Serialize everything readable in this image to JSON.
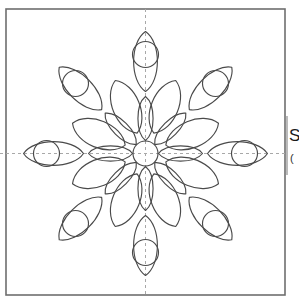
{
  "document": {
    "type": "stencil-pattern-sheet",
    "background_color": "#ffffff"
  },
  "frame": {
    "name": "pattern-border",
    "x": 6,
    "y": 9,
    "width": 279,
    "height": 286,
    "stroke_color": "#6e6e6e",
    "stroke_width": 1.6,
    "fill": "none"
  },
  "guides": {
    "stroke_color": "#a8a8a8",
    "dash": "3 3",
    "stroke_width": 1,
    "vertical": {
      "x": 145.5,
      "y1": 9,
      "y2": 295
    },
    "horizontal": {
      "y": 153.5,
      "x1": 0,
      "x2": 287
    }
  },
  "margin_rule": {
    "name": "right-margin-rule",
    "x": 287,
    "y1": 116,
    "y2": 175,
    "stroke_color": "#8c8c8c",
    "stroke_width": 1.2
  },
  "side_text": {
    "label": "Sp",
    "subtext": "("
  },
  "motif": {
    "name": "floral-mandala",
    "center_x": 145.5,
    "center_y": 153.5,
    "stroke_color": "#4a4a4a",
    "stroke_width": 1.15,
    "fill": "none",
    "center_circle": {
      "radius": 12.5
    },
    "rings": [
      {
        "name": "inner-petal-ring",
        "count": 8,
        "start_angle": -90,
        "inner_radius": 13,
        "outer_radius": 57,
        "half_width": 14,
        "description": "eight slim pointed-oval petals radiating from the central circle"
      },
      {
        "name": "middle-petal-ring",
        "count": 8,
        "start_angle": -67.5,
        "inner_radius": 22,
        "outer_radius": 79,
        "half_width": 25,
        "description": "eight broad leaf petals offset between the inner petals"
      },
      {
        "name": "outer-petal-ring",
        "count": 8,
        "start_angle": -90,
        "inner_radius": 62,
        "outer_radius": 122,
        "half_width": 22,
        "description": "eight outer pointed-oval petals aligned with the inner petals"
      }
    ],
    "circle_ring": {
      "name": "accent-circle-ring",
      "count": 8,
      "start_angle": -90,
      "orbit_radius": 99,
      "radius": 13,
      "description": "eight small circles between the outer petal tips"
    }
  }
}
